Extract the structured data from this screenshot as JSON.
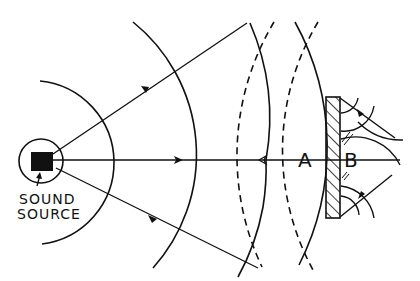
{
  "diagram": {
    "labels": {
      "source_line1": "SOUND",
      "source_line2": "SOURCE",
      "point_a": "A",
      "point_b": "B"
    },
    "colors": {
      "ink": "#111111",
      "background": "#ffffff"
    },
    "elements": [
      {
        "name": "sound-source",
        "type": "filled-square"
      },
      {
        "name": "source-circle",
        "type": "circle"
      },
      {
        "name": "incident-wavefronts",
        "style": "solid",
        "count": 4
      },
      {
        "name": "reflected-wavefronts",
        "style": "dashed",
        "count": 2
      },
      {
        "name": "rays",
        "count": 3,
        "direction": "outward from source"
      },
      {
        "name": "barrier",
        "type": "hatched-wall"
      },
      {
        "name": "diffracted-wavefronts",
        "location": "behind barrier"
      }
    ]
  }
}
